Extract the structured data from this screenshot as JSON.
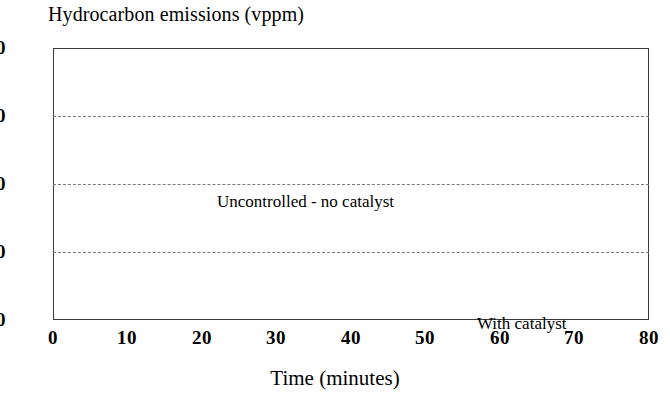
{
  "chart_data": {
    "type": "line",
    "title": "Hydrocarbon emissions (vppm)",
    "xlabel": "Time (minutes)",
    "ylabel": "",
    "xlim": [
      0,
      80
    ],
    "ylim": [
      0,
      80
    ],
    "xticks": [
      "0",
      "10",
      "20",
      "30",
      "40",
      "50",
      "60",
      "70",
      "80"
    ],
    "yticks": [
      "0",
      "20",
      "40",
      "60",
      "80"
    ],
    "grid": "horizontal-dashed",
    "legend": "inline-annotations",
    "line_color": "#1a1a1a",
    "series": [
      {
        "name": "Uncontrolled - no catalyst",
        "x": [
          1,
          3,
          5,
          7,
          9,
          11,
          13,
          15,
          17,
          19,
          21,
          23,
          25,
          27,
          29,
          31,
          33,
          35,
          37,
          38,
          40,
          42,
          44,
          46,
          48,
          50,
          52,
          54,
          56,
          58,
          60,
          62,
          64,
          66,
          68,
          70,
          71,
          73,
          75,
          76
        ],
        "values": [
          53.2,
          53.0,
          52.8,
          53.4,
          53.2,
          53.8,
          54.6,
          55.4,
          56.2,
          56.6,
          56.2,
          55.2,
          53.6,
          52.4,
          52.8,
          54.2,
          56.2,
          58.2,
          59.8,
          60.0,
          58.6,
          56.4,
          54.2,
          52.6,
          51.2,
          50.4,
          50.2,
          49.8,
          50.2,
          50.8,
          51.6,
          52.4,
          52.2,
          51.4,
          49.8,
          47.0,
          45.6,
          45.4,
          46.4,
          47.0
        ]
      },
      {
        "name": "With catalyst",
        "x": [
          1,
          5,
          9,
          13,
          17,
          21,
          25,
          29,
          33,
          35,
          37,
          39,
          41,
          45,
          49,
          53,
          57,
          61,
          65,
          69,
          73,
          76
        ],
        "values": [
          9.2,
          9.2,
          9.0,
          9.2,
          9.4,
          9.6,
          9.8,
          9.8,
          10.2,
          10.4,
          10.5,
          10.3,
          10.0,
          9.8,
          9.6,
          9.4,
          9.2,
          9.0,
          8.8,
          8.6,
          8.3,
          8.2
        ]
      }
    ],
    "annotations": [
      {
        "text": "Uncontrolled - no catalyst",
        "x": 15,
        "y": 47
      },
      {
        "text": "With catalyst",
        "x": 50,
        "y": 14
      }
    ]
  }
}
